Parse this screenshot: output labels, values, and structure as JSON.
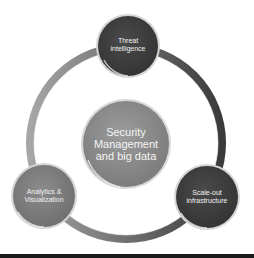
{
  "diagram": {
    "type": "cycle",
    "center_node": {
      "lines": [
        "Security",
        "Management",
        "and big data"
      ],
      "color": "#8a8a8a"
    },
    "outer_nodes": [
      {
        "id": "threat",
        "lines": [
          "Threat",
          "intelligence"
        ],
        "position": "top",
        "color": "#3e3e3e"
      },
      {
        "id": "analytics",
        "lines": [
          "Analytics &",
          "Visualization"
        ],
        "position": "bottom-left",
        "color": "#7c7c7c"
      },
      {
        "id": "scale",
        "lines": [
          "Scale-out",
          "infrastructure"
        ],
        "position": "bottom-right",
        "color": "#3a3a3a"
      }
    ],
    "ring": {
      "color_left": "#9a9a9a",
      "color_right": "#3c3c3c"
    }
  }
}
